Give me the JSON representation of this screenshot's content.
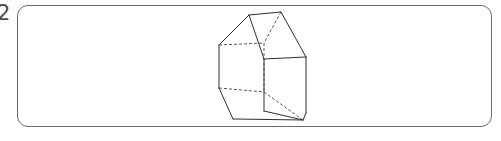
{
  "page": {
    "width": 501,
    "height": 141,
    "background_color": "#ffffff"
  },
  "question_number": {
    "label": "2",
    "color": "#4a4a4a"
  },
  "answer_frame": {
    "name": "answer-box",
    "stroke_color": "#6b6b6b",
    "fill_color": "#ffffff",
    "corner_radius": 11,
    "x": 17,
    "y": 5,
    "width": 475,
    "height": 122
  },
  "figure": {
    "name": "house-prism-wireframe",
    "solid_stroke_color": "#2f2f2f",
    "hidden_stroke_color": "#555555",
    "stroke_width": 1,
    "hidden_dash_pattern": "3,2",
    "vertices": {
      "front_apex": [
        249,
        15
      ],
      "front_eave_left": [
        220,
        44
      ],
      "front_eave_right": [
        262,
        58
      ],
      "front_base_left": [
        220,
        88
      ],
      "front_base_right": [
        262,
        103
      ],
      "back_apex": [
        281,
        12
      ],
      "back_eave_left": [
        252,
        41
      ],
      "back_eave_right": [
        294,
        55
      ],
      "back_base_left": [
        252,
        85
      ],
      "back_base_right": [
        294,
        100
      ],
      "bottom_front_left": [
        220,
        88
      ],
      "bottom_front_right": [
        262,
        103
      ],
      "bottom_far_left": [
        232,
        119
      ],
      "bottom_far_right": [
        303,
        120
      ]
    },
    "solid_edges": [
      "ridge-top",
      "front-left-roof-slope",
      "right-roof-slope",
      "right-gable-face",
      "front-vertical-left",
      "base-front",
      "base-right",
      "right-face-outline"
    ],
    "hidden_edges": [
      "back-left-eave",
      "back-vertical",
      "back-base",
      "interior-diagonal",
      "back-ridge-slope"
    ]
  }
}
